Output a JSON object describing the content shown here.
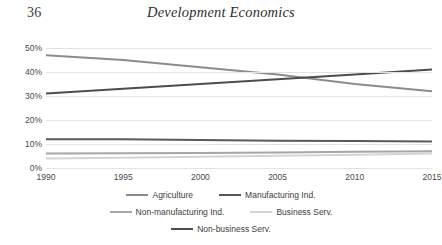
{
  "header": {
    "page_number": "36",
    "title": "Development Economics"
  },
  "chart_data": {
    "type": "line",
    "title": "",
    "xlabel": "",
    "ylabel": "",
    "x": [
      1990,
      1995,
      2000,
      2005,
      2010,
      2015
    ],
    "xtick_labels": [
      "1990",
      "1995",
      "2000",
      "2005",
      "2010",
      "2015"
    ],
    "ytick_labels": [
      "0%",
      "10%",
      "20%",
      "30%",
      "40%",
      "50%"
    ],
    "ytick_values": [
      0,
      10,
      20,
      30,
      40,
      50
    ],
    "ylim": [
      0,
      50
    ],
    "xlim": [
      1990,
      2015
    ],
    "grid": true,
    "legend_position": "bottom",
    "series": [
      {
        "name": "Agriculture",
        "color": "#8c8c8c",
        "width": 2.0,
        "values": [
          47,
          45,
          42,
          39,
          35,
          32
        ]
      },
      {
        "name": "Manufacturing Ind.",
        "color": "#595959",
        "width": 2.0,
        "values": [
          12,
          12,
          11.7,
          11.4,
          11.2,
          11
        ]
      },
      {
        "name": "Non-manufacturing Ind.",
        "color": "#a6a6a6",
        "width": 2.0,
        "values": [
          6,
          6.1,
          6.3,
          6.5,
          6.8,
          7
        ]
      },
      {
        "name": "Business Serv.",
        "color": "#d4d4d4",
        "width": 2.0,
        "values": [
          4,
          4.3,
          4.7,
          5.1,
          5.5,
          6
        ]
      },
      {
        "name": "Non-business Serv.",
        "color": "#4d4d4d",
        "width": 2.0,
        "values": [
          31,
          33,
          35,
          37,
          39,
          41
        ]
      }
    ]
  },
  "legend_rows": [
    [
      {
        "name": "Agriculture",
        "color": "#8c8c8c"
      },
      {
        "name": "Manufacturing Ind.",
        "color": "#595959"
      }
    ],
    [
      {
        "name": "Non-manufacturing Ind.",
        "color": "#a6a6a6"
      },
      {
        "name": "Business Serv.",
        "color": "#d4d4d4"
      }
    ],
    [
      {
        "name": "Non-business Serv.",
        "color": "#4d4d4d"
      }
    ]
  ],
  "colors": {
    "gridline": "#e2e2e2",
    "text": "#404040",
    "background": "#ffffff"
  }
}
